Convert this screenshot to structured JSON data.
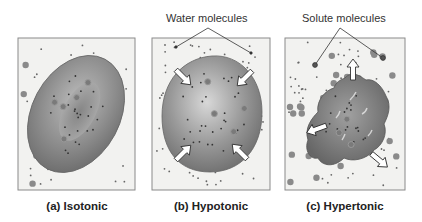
{
  "callouts": {
    "water": "Water molecules",
    "solute": "Solute molecules"
  },
  "panels": [
    {
      "id": "a",
      "caption": "(a) Isotonic",
      "condition": "isotonic",
      "water_flow": "none"
    },
    {
      "id": "b",
      "caption": "(b) Hypotonic",
      "condition": "hypotonic",
      "water_flow": "inward"
    },
    {
      "id": "c",
      "caption": "(c) Hypertonic",
      "condition": "hypertonic",
      "water_flow": "outward"
    }
  ],
  "colors": {
    "background": "#f2f2f0",
    "frame": "#8a8a8a",
    "cell_dark": "#6e6e6e",
    "cell_light": "#c8c8c8",
    "solute": "#7a7a7a",
    "water": "#555555",
    "arrow_fill": "#ffffff",
    "arrow_stroke": "#333333"
  }
}
